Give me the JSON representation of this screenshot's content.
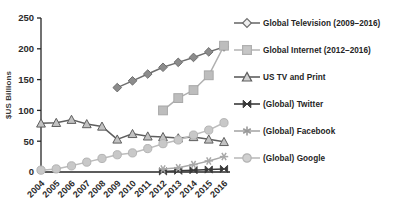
{
  "chart_data": {
    "type": "line",
    "title": "",
    "xlabel": "",
    "ylabel": "$US Billions",
    "ylim": [
      0,
      250
    ],
    "yticks": [
      0,
      50,
      100,
      150,
      200,
      250
    ],
    "grid": false,
    "legend_position": "right",
    "x": [
      2004,
      2005,
      2006,
      2007,
      2008,
      2009,
      2010,
      2011,
      2012,
      2013,
      2014,
      2015,
      2016
    ],
    "categories": [
      "2004",
      "2005",
      "2006",
      "2007",
      "2008",
      "2009",
      "2010",
      "2011",
      "2012",
      "2013",
      "2014",
      "2015",
      "2016"
    ],
    "series": [
      {
        "name": "Global Television (2009–2016)",
        "marker": "diamond",
        "color": "#8c8c8c",
        "line_color": "#6e6e6e",
        "values": [
          null,
          null,
          null,
          null,
          null,
          137,
          148,
          159,
          170,
          178,
          186,
          195,
          203
        ]
      },
      {
        "name": "Global Internet (2012–2016)",
        "marker": "square",
        "color": "#bdbdbd",
        "line_color": "#b0b0b0",
        "values": [
          null,
          null,
          null,
          null,
          null,
          null,
          null,
          null,
          100,
          120,
          133,
          157,
          205
        ]
      },
      {
        "name": "US TV and Print",
        "marker": "triangle",
        "color": "#c2c2c2",
        "line_color": "#5e5e5e",
        "values": [
          79,
          80,
          85,
          78,
          74,
          53,
          62,
          58,
          57,
          55,
          57,
          53,
          49
        ]
      },
      {
        "name": "(Global) Twitter",
        "marker": "bowtie",
        "color": "#3a3a3a",
        "line_color": "#3a3a3a",
        "values": [
          null,
          null,
          null,
          null,
          null,
          null,
          null,
          null,
          1,
          2,
          3,
          4,
          5
        ]
      },
      {
        "name": "(Global) Facebook",
        "marker": "asterisk",
        "color": "#a8a8a8",
        "line_color": "#a8a8a8",
        "values": [
          null,
          null,
          null,
          null,
          null,
          null,
          null,
          null,
          5,
          7,
          12,
          18,
          25
        ]
      },
      {
        "name": "(Global) Google",
        "marker": "circle",
        "color": "#c8c8c8",
        "line_color": "#bcbcbc",
        "values": [
          3,
          5,
          10,
          16,
          22,
          28,
          31,
          38,
          46,
          52,
          60,
          68,
          80
        ]
      }
    ]
  },
  "axis": {
    "ylabel": "$US Billions",
    "ytick_labels": [
      "0",
      "50",
      "100",
      "150",
      "200",
      "250"
    ],
    "xtick_labels": [
      "2004",
      "2005",
      "2006",
      "2007",
      "2008",
      "2009",
      "2010",
      "2011",
      "2012",
      "2013",
      "2014",
      "2015",
      "2016"
    ]
  },
  "legend": {
    "items": [
      {
        "label": "Global Television (2009–2016)",
        "marker": "diamond-marker-icon"
      },
      {
        "label": "Global Internet (2012–2016)",
        "marker": "square-marker-icon"
      },
      {
        "label": "US TV and Print",
        "marker": "triangle-marker-icon"
      },
      {
        "label": "(Global) Twitter",
        "marker": "bowtie-marker-icon"
      },
      {
        "label": "(Global) Facebook",
        "marker": "asterisk-marker-icon"
      },
      {
        "label": "(Global) Google",
        "marker": "circle-marker-icon"
      }
    ]
  }
}
